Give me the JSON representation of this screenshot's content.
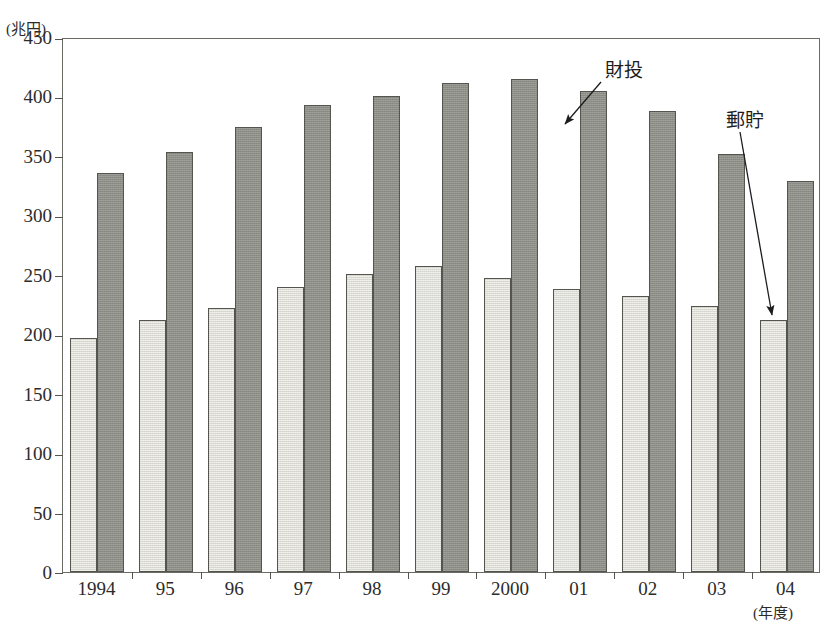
{
  "chart_data": {
    "type": "bar",
    "title": "",
    "xlabel": "(年度)",
    "ylabel": "(兆円)",
    "ylim": [
      0,
      450
    ],
    "yticks": [
      0,
      50,
      100,
      150,
      200,
      250,
      300,
      350,
      400,
      450
    ],
    "ytick_labels": [
      "0",
      "50",
      "100",
      "150",
      "200",
      "250",
      "300",
      "350",
      "400",
      "450"
    ],
    "grid": false,
    "legend_position": "annotation-arrows",
    "categories": [
      "1994",
      "95",
      "96",
      "97",
      "98",
      "99",
      "2000",
      "01",
      "02",
      "03",
      "04"
    ],
    "series": [
      {
        "name": "郵貯",
        "color": "#dcdcd5",
        "values": [
          197,
          212,
          222,
          240,
          251,
          257,
          247,
          238,
          232,
          224,
          212
        ]
      },
      {
        "name": "財投",
        "color": "#8e8e88",
        "values": [
          336,
          353,
          374,
          393,
          400,
          411,
          415,
          405,
          388,
          352,
          329
        ]
      }
    ],
    "annotations": [
      {
        "text": "財投",
        "label_x": 605,
        "label_y": 60,
        "arrow_from_x": 601,
        "arrow_from_y": 82,
        "arrow_to_x": 565,
        "arrow_to_y": 124,
        "points_to": "財投 bar (01)"
      },
      {
        "text": "郵貯",
        "label_x": 726,
        "label_y": 110,
        "arrow_from_x": 740,
        "arrow_from_y": 132,
        "arrow_to_x": 772,
        "arrow_to_y": 315,
        "points_to": "郵貯 bar (04)"
      }
    ]
  },
  "axes": {
    "y_unit_label": "(兆円)",
    "x_unit_label": "(年度)"
  },
  "colors": {
    "light_bar": "#dcdcd5",
    "dark_bar": "#8e8e88",
    "bar_outline": "#55554f",
    "frame": "#6b6b66",
    "text": "#2b2b2b"
  }
}
